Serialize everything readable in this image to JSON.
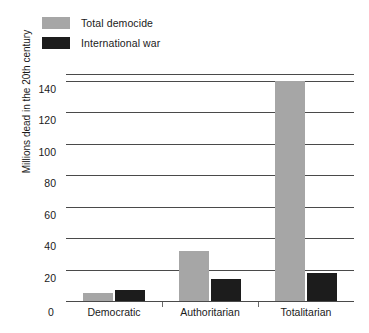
{
  "chart_data": {
    "type": "bar",
    "title": "",
    "xlabel": "",
    "ylabel": "Millions dead in the 20th century",
    "categories": [
      "Democratic",
      "Authoritarian",
      "Totalitarian"
    ],
    "series": [
      {
        "name": "Total democide",
        "color": "#a6a6a6",
        "values": [
          5,
          32,
          140
        ]
      },
      {
        "name": "International war",
        "color": "#1c1c1c",
        "values": [
          7,
          14,
          18
        ]
      }
    ],
    "ylim": [
      0,
      145
    ],
    "yticks": [
      0,
      20,
      40,
      60,
      80,
      100,
      120,
      140
    ],
    "ytick_labels": [
      "0",
      "20",
      "40",
      "60",
      "80",
      "100",
      "120",
      "140"
    ],
    "grid": "horizontal",
    "legend_position": "top-left"
  },
  "legend": {
    "items": [
      {
        "label": "Total democide",
        "swatch": "#a6a6a6",
        "icon": "legend-swatch-gray"
      },
      {
        "label": "International war",
        "swatch": "#1c1c1c",
        "icon": "legend-swatch-black"
      }
    ]
  },
  "axis": {
    "y_title": "Millions dead in the 20th century",
    "zero_label": "0"
  }
}
